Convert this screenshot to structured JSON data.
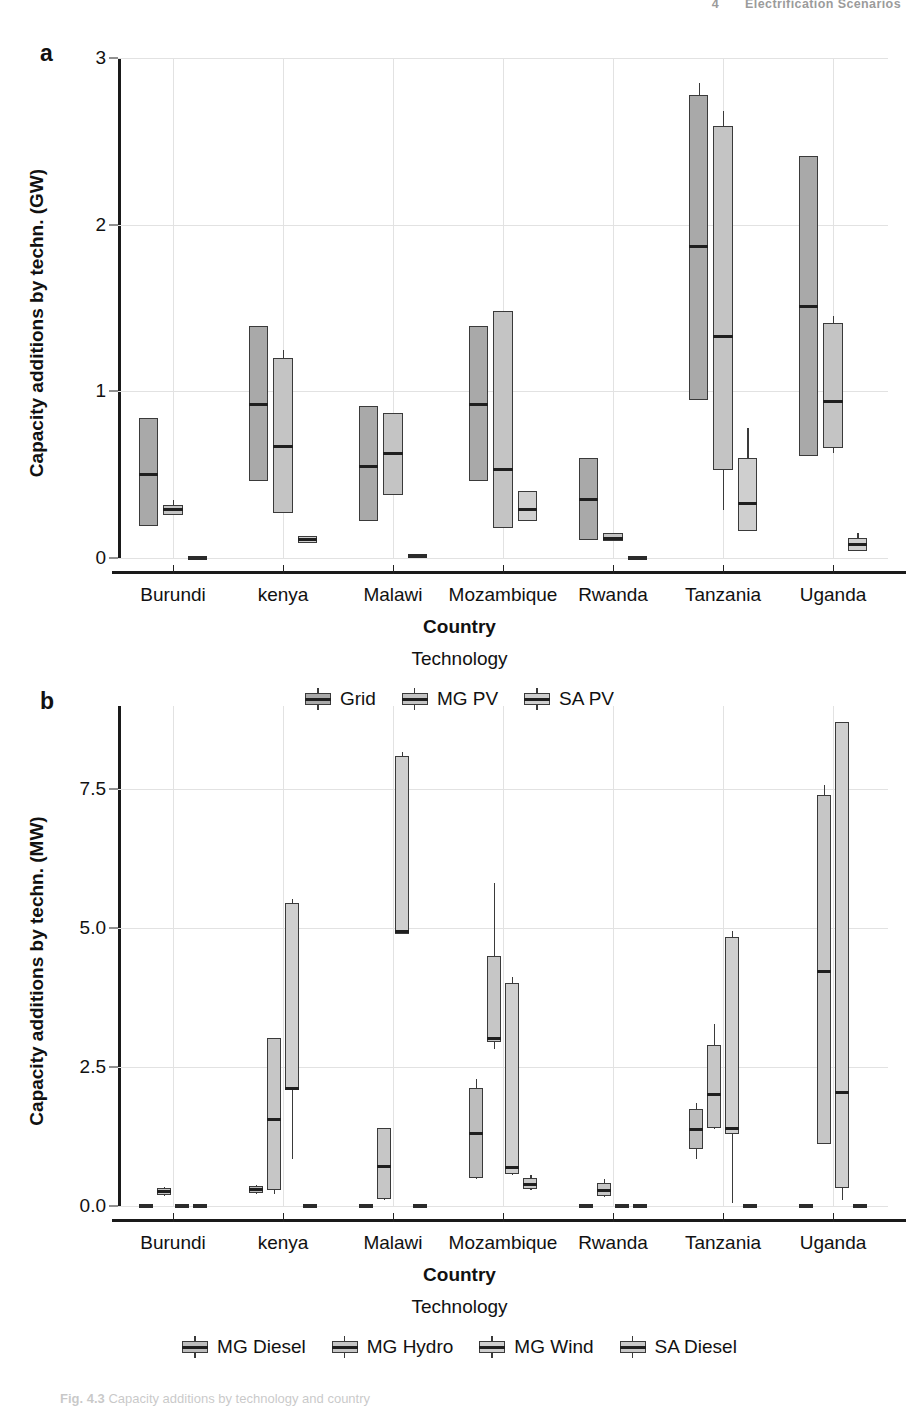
{
  "running_head": {
    "page": "4",
    "title": "Electrification Scenarios"
  },
  "caption": {
    "label": "Fig. 4.3",
    "text": "Capacity additions by technology and country"
  },
  "panels": [
    {
      "letter": "a",
      "ylabel": "Capacity additions by techn. (GW)",
      "xlabel": "Country",
      "legend_title": "Technology",
      "yticks": [
        "0",
        "1",
        "2",
        "3"
      ],
      "legend": [
        {
          "label": "Grid",
          "color": "#a9a9a9"
        },
        {
          "label": "MG PV",
          "color": "#c4c4c4"
        },
        {
          "label": "SA PV",
          "color": "#cfcfcf"
        }
      ]
    },
    {
      "letter": "b",
      "ylabel": "Capacity additions by techn. (MW)",
      "xlabel": "Country",
      "legend_title": "Technology",
      "yticks": [
        "0.0",
        "2.5",
        "5.0",
        "7.5"
      ],
      "legend": [
        {
          "label": "MG Diesel",
          "color": "#bdbdbd"
        },
        {
          "label": "MG Hydro",
          "color": "#c6c6c6"
        },
        {
          "label": "MG Wind",
          "color": "#cfcfcf"
        },
        {
          "label": "SA Diesel",
          "color": "#c9c9c9"
        }
      ]
    }
  ],
  "chart_data": [
    {
      "type": "boxplot",
      "panel": "a",
      "title": "",
      "xlabel": "Country",
      "ylabel": "Capacity additions by techn. (GW)",
      "ylim": [
        0,
        3
      ],
      "yticks": [
        0,
        1,
        2,
        3
      ],
      "grid": true,
      "legend_position": "bottom",
      "categories": [
        "Burundi",
        "kenya",
        "Malawi",
        "Mozambique",
        "Rwanda",
        "Tanzania",
        "Uganda"
      ],
      "series": [
        {
          "name": "Grid",
          "color": "#a9a9a9",
          "boxes": [
            {
              "category": "Burundi",
              "whisker_low": 0.19,
              "q1": 0.19,
              "median": 0.5,
              "q3": 0.84,
              "whisker_high": 0.84
            },
            {
              "category": "kenya",
              "whisker_low": 0.46,
              "q1": 0.46,
              "median": 0.92,
              "q3": 1.39,
              "whisker_high": 1.39
            },
            {
              "category": "Malawi",
              "whisker_low": 0.22,
              "q1": 0.22,
              "median": 0.55,
              "q3": 0.91,
              "whisker_high": 0.91
            },
            {
              "category": "Mozambique",
              "whisker_low": 0.46,
              "q1": 0.46,
              "median": 0.92,
              "q3": 1.39,
              "whisker_high": 1.39
            },
            {
              "category": "Rwanda",
              "whisker_low": 0.11,
              "q1": 0.11,
              "median": 0.35,
              "q3": 0.6,
              "whisker_high": 0.6
            },
            {
              "category": "Tanzania",
              "whisker_low": 0.95,
              "q1": 0.95,
              "median": 1.87,
              "q3": 2.78,
              "whisker_high": 2.85
            },
            {
              "category": "Uganda",
              "whisker_low": 0.61,
              "q1": 0.61,
              "median": 1.51,
              "q3": 2.41,
              "whisker_high": 2.41
            }
          ]
        },
        {
          "name": "MG PV",
          "color": "#c4c4c4",
          "boxes": [
            {
              "category": "Burundi",
              "whisker_low": 0.26,
              "q1": 0.26,
              "median": 0.29,
              "q3": 0.32,
              "whisker_high": 0.35
            },
            {
              "category": "kenya",
              "whisker_low": 0.27,
              "q1": 0.27,
              "median": 0.67,
              "q3": 1.2,
              "whisker_high": 1.25
            },
            {
              "category": "Malawi",
              "whisker_low": 0.38,
              "q1": 0.38,
              "median": 0.63,
              "q3": 0.87,
              "whisker_high": 0.87
            },
            {
              "category": "Mozambique",
              "whisker_low": 0.18,
              "q1": 0.18,
              "median": 0.53,
              "q3": 1.48,
              "whisker_high": 1.48
            },
            {
              "category": "Rwanda",
              "whisker_low": 0.1,
              "q1": 0.1,
              "median": 0.12,
              "q3": 0.15,
              "whisker_high": 0.15
            },
            {
              "category": "Tanzania",
              "whisker_low": 0.29,
              "q1": 0.53,
              "median": 1.33,
              "q3": 2.59,
              "whisker_high": 2.68
            },
            {
              "category": "Uganda",
              "whisker_low": 0.63,
              "q1": 0.66,
              "median": 0.94,
              "q3": 1.41,
              "whisker_high": 1.45
            }
          ]
        },
        {
          "name": "SA PV",
          "color": "#cfcfcf",
          "boxes": [
            {
              "category": "Burundi",
              "whisker_low": 0.0,
              "q1": 0.0,
              "median": 0.0,
              "q3": 0.01,
              "whisker_high": 0.01
            },
            {
              "category": "kenya",
              "whisker_low": 0.09,
              "q1": 0.09,
              "median": 0.11,
              "q3": 0.13,
              "whisker_high": 0.13
            },
            {
              "category": "Malawi",
              "whisker_low": 0.0,
              "q1": 0.0,
              "median": 0.01,
              "q3": 0.02,
              "whisker_high": 0.02
            },
            {
              "category": "Mozambique",
              "whisker_low": 0.22,
              "q1": 0.22,
              "median": 0.29,
              "q3": 0.4,
              "whisker_high": 0.4
            },
            {
              "category": "Rwanda",
              "whisker_low": 0.0,
              "q1": 0.0,
              "median": 0.0,
              "q3": 0.01,
              "whisker_high": 0.01
            },
            {
              "category": "Tanzania",
              "whisker_low": 0.16,
              "q1": 0.16,
              "median": 0.33,
              "q3": 0.6,
              "whisker_high": 0.78
            },
            {
              "category": "Uganda",
              "whisker_low": 0.04,
              "q1": 0.04,
              "median": 0.08,
              "q3": 0.12,
              "whisker_high": 0.15
            }
          ]
        }
      ]
    },
    {
      "type": "boxplot",
      "panel": "b",
      "title": "",
      "xlabel": "Country",
      "ylabel": "Capacity additions by techn. (MW)",
      "ylim": [
        0,
        9
      ],
      "yticks": [
        0.0,
        2.5,
        5.0,
        7.5
      ],
      "grid": true,
      "legend_position": "bottom",
      "categories": [
        "Burundi",
        "kenya",
        "Malawi",
        "Mozambique",
        "Rwanda",
        "Tanzania",
        "Uganda"
      ],
      "series": [
        {
          "name": "MG Diesel",
          "color": "#bdbdbd",
          "boxes": [
            {
              "category": "Burundi",
              "whisker_low": 0.0,
              "q1": 0.0,
              "median": 0.0,
              "q3": 0.02,
              "whisker_high": 0.02
            },
            {
              "category": "kenya",
              "whisker_low": 0.22,
              "q1": 0.24,
              "median": 0.3,
              "q3": 0.36,
              "whisker_high": 0.38
            },
            {
              "category": "Malawi",
              "whisker_low": 0.0,
              "q1": 0.0,
              "median": 0.0,
              "q3": 0.03,
              "whisker_high": 0.03
            },
            {
              "category": "Mozambique",
              "whisker_low": 0.48,
              "q1": 0.5,
              "median": 1.3,
              "q3": 2.12,
              "whisker_high": 2.28
            },
            {
              "category": "Rwanda",
              "whisker_low": 0.0,
              "q1": 0.0,
              "median": 0.0,
              "q3": 0.02,
              "whisker_high": 0.02
            },
            {
              "category": "Tanzania",
              "whisker_low": 0.85,
              "q1": 1.02,
              "median": 1.37,
              "q3": 1.75,
              "whisker_high": 1.85
            },
            {
              "category": "Uganda",
              "whisker_low": 0.0,
              "q1": 0.0,
              "median": 0.0,
              "q3": 0.03,
              "whisker_high": 0.03
            }
          ]
        },
        {
          "name": "MG Hydro",
          "color": "#c6c6c6",
          "boxes": [
            {
              "category": "Burundi",
              "whisker_low": 0.18,
              "q1": 0.2,
              "median": 0.26,
              "q3": 0.32,
              "whisker_high": 0.34
            },
            {
              "category": "kenya",
              "whisker_low": 0.22,
              "q1": 0.28,
              "median": 1.56,
              "q3": 3.02,
              "whisker_high": 3.02
            },
            {
              "category": "Malawi",
              "whisker_low": 0.1,
              "q1": 0.12,
              "median": 0.72,
              "q3": 1.4,
              "whisker_high": 1.4
            },
            {
              "category": "Mozambique",
              "whisker_low": 2.82,
              "q1": 2.95,
              "median": 3.02,
              "q3": 4.5,
              "whisker_high": 5.82
            },
            {
              "category": "Rwanda",
              "whisker_low": 0.16,
              "q1": 0.18,
              "median": 0.28,
              "q3": 0.42,
              "whisker_high": 0.48
            },
            {
              "category": "Tanzania",
              "whisker_low": 1.38,
              "q1": 1.4,
              "median": 2.0,
              "q3": 2.9,
              "whisker_high": 3.28
            },
            {
              "category": "Uganda",
              "whisker_low": 1.12,
              "q1": 1.12,
              "median": 4.22,
              "q3": 7.4,
              "whisker_high": 7.58
            }
          ]
        },
        {
          "name": "MG Wind",
          "color": "#cfcfcf",
          "boxes": [
            {
              "category": "Burundi",
              "whisker_low": 0.0,
              "q1": 0.0,
              "median": 0.0,
              "q3": 0.02,
              "whisker_high": 0.02
            },
            {
              "category": "kenya",
              "whisker_low": 0.85,
              "q1": 2.08,
              "median": 2.12,
              "q3": 5.46,
              "whisker_high": 5.52
            },
            {
              "category": "Malawi",
              "whisker_low": 4.9,
              "q1": 4.9,
              "median": 4.95,
              "q3": 8.1,
              "whisker_high": 8.18
            },
            {
              "category": "Mozambique",
              "whisker_low": 0.55,
              "q1": 0.58,
              "median": 0.7,
              "q3": 4.02,
              "whisker_high": 4.12
            },
            {
              "category": "Rwanda",
              "whisker_low": 0.0,
              "q1": 0.0,
              "median": 0.0,
              "q3": 0.02,
              "whisker_high": 0.02
            },
            {
              "category": "Tanzania",
              "whisker_low": 0.05,
              "q1": 1.3,
              "median": 1.4,
              "q3": 4.85,
              "whisker_high": 4.95
            },
            {
              "category": "Uganda",
              "whisker_low": 0.1,
              "q1": 0.32,
              "median": 2.05,
              "q3": 8.72,
              "whisker_high": 8.72
            }
          ]
        },
        {
          "name": "SA Diesel",
          "color": "#c9c9c9",
          "boxes": [
            {
              "category": "Burundi",
              "whisker_low": 0.0,
              "q1": 0.0,
              "median": 0.0,
              "q3": 0.02,
              "whisker_high": 0.02
            },
            {
              "category": "kenya",
              "whisker_low": 0.0,
              "q1": 0.0,
              "median": 0.0,
              "q3": 0.02,
              "whisker_high": 0.02
            },
            {
              "category": "Malawi",
              "whisker_low": 0.0,
              "q1": 0.0,
              "median": 0.0,
              "q3": 0.02,
              "whisker_high": 0.02
            },
            {
              "category": "Mozambique",
              "whisker_low": 0.28,
              "q1": 0.3,
              "median": 0.38,
              "q3": 0.5,
              "whisker_high": 0.56
            },
            {
              "category": "Rwanda",
              "whisker_low": 0.0,
              "q1": 0.0,
              "median": 0.0,
              "q3": 0.02,
              "whisker_high": 0.02
            },
            {
              "category": "Tanzania",
              "whisker_low": 0.0,
              "q1": 0.0,
              "median": 0.0,
              "q3": 0.02,
              "whisker_high": 0.02
            },
            {
              "category": "Uganda",
              "whisker_low": 0.0,
              "q1": 0.0,
              "median": 0.0,
              "q3": 0.02,
              "whisker_high": 0.02
            }
          ]
        }
      ]
    }
  ]
}
